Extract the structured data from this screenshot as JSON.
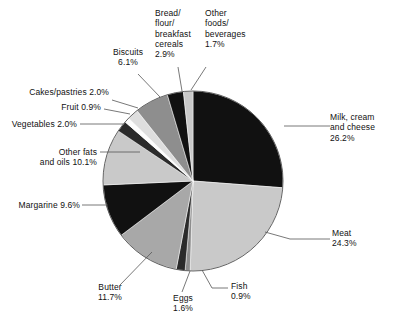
{
  "chart_data": {
    "type": "pie",
    "title": "",
    "subtitle": "",
    "xlabel": "",
    "ylabel": "",
    "units": "percent",
    "legend_position": "none",
    "grid": false,
    "start_angle_deg": 0,
    "direction": "clockwise",
    "categories": [
      "Milk, cream and cheese",
      "Meat",
      "Fish",
      "Eggs",
      "Butter",
      "Margarine",
      "Other fats and oils",
      "Vegetables",
      "Fruit",
      "Cakes/pastries",
      "Biscuits",
      "Bread/flour/breakfast cereals",
      "Other foods/beverages"
    ],
    "values": [
      26.2,
      24.3,
      0.9,
      1.6,
      11.7,
      9.6,
      10.1,
      2.0,
      0.9,
      2.0,
      6.1,
      2.9,
      1.7
    ],
    "colors": [
      "#111111",
      "#c9c9c9",
      "#8e8e8e",
      "#2b2b2b",
      "#a8a8a8",
      "#111111",
      "#c9c9c9",
      "#2b2b2b",
      "#fdfdfd",
      "#dedede",
      "#8e8e8e",
      "#111111",
      "#c9c9c9"
    ],
    "slices": [
      {
        "name": "Milk, cream and cheese",
        "value": 26.2,
        "label": "Milk, cream\nand cheese\n26.2%",
        "color": "#111111"
      },
      {
        "name": "Meat",
        "value": 24.3,
        "label": "Meat\n24.3%",
        "color": "#c9c9c9"
      },
      {
        "name": "Fish",
        "value": 0.9,
        "label": "Fish\n0.9%",
        "color": "#8e8e8e"
      },
      {
        "name": "Eggs",
        "value": 1.6,
        "label": "Eggs\n1.6%",
        "color": "#2b2b2b"
      },
      {
        "name": "Butter",
        "value": 11.7,
        "label": "Butter\n11.7%",
        "color": "#a8a8a8"
      },
      {
        "name": "Margarine",
        "value": 9.6,
        "label": "Margarine  9.6%",
        "color": "#111111"
      },
      {
        "name": "Other fats and oils",
        "value": 10.1,
        "label": "Other fats\nand oils  10.1%",
        "color": "#c9c9c9"
      },
      {
        "name": "Vegetables",
        "value": 2.0,
        "label": "Vegetables  2.0%",
        "color": "#2b2b2b"
      },
      {
        "name": "Fruit",
        "value": 0.9,
        "label": "Fruit  0.9%",
        "color": "#fdfdfd"
      },
      {
        "name": "Cakes/pastries",
        "value": 2.0,
        "label": "Cakes/pastries  2.0%",
        "color": "#dedede"
      },
      {
        "name": "Biscuits",
        "value": 6.1,
        "label": "Biscuits\n6.1%",
        "color": "#8e8e8e"
      },
      {
        "name": "Bread/flour/breakfast cereals",
        "value": 2.9,
        "label": "Bread/\nflour/\nbreakfast\ncereals\n2.9%",
        "color": "#111111"
      },
      {
        "name": "Other foods/beverages",
        "value": 1.7,
        "label": "Other\nfoods/\nbeverages\n1.7%",
        "color": "#c9c9c9"
      }
    ]
  },
  "labels": {
    "milk": "Milk, cream\nand cheese\n26.2%",
    "meat": "Meat\n24.3%",
    "fish": "Fish\n0.9%",
    "eggs": "Eggs\n1.6%",
    "butter": "Butter\n11.7%",
    "margarine": "Margarine  9.6%",
    "other_fats": "Other fats\nand oils  10.1%",
    "vegetables": "Vegetables  2.0%",
    "fruit": "Fruit  0.9%",
    "cakes": "Cakes/pastries  2.0%",
    "biscuits": "Biscuits\n6.1%",
    "bread": "Bread/\nflour/\nbreakfast\ncereals\n2.9%",
    "other_foods": "Other\nfoods/\nbeverages\n1.7%"
  },
  "style": {
    "background": "#ffffff",
    "outline": "#555555",
    "leader": "#555555",
    "text": "#111111"
  }
}
